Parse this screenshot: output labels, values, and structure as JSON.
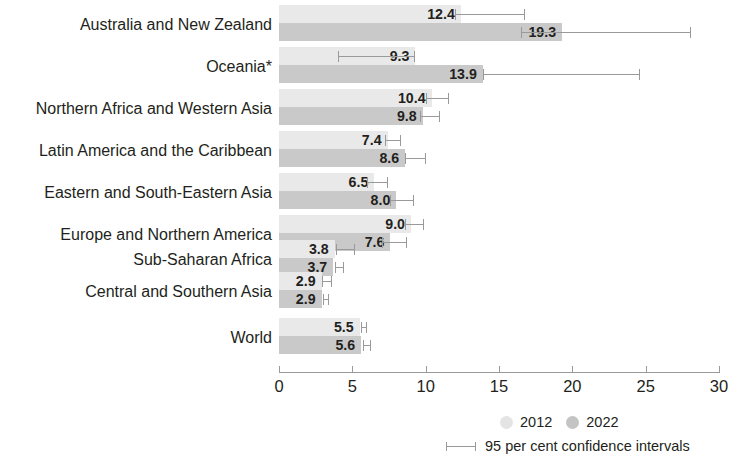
{
  "chart_data": {
    "type": "bar",
    "orientation": "horizontal",
    "title": "",
    "subtitle": "",
    "xlabel": "",
    "ylabel": "",
    "xlim": [
      0,
      30
    ],
    "xticks": [
      0,
      5,
      10,
      15,
      20,
      25,
      30
    ],
    "xtick_labels": [
      "0",
      "5",
      "10",
      "15",
      "20",
      "25",
      "30"
    ],
    "grid": false,
    "legend_position": "bottom-right",
    "legend_entries": [
      "2012",
      "2022"
    ],
    "ci_note": "95 per cent confidence intervals",
    "footnote_marker": "*",
    "categories": [
      "Australia and New Zealand",
      "Oceania*",
      "Northern Africa and Western Asia",
      "Latin America and the Caribbean",
      "Eastern and South-Eastern Asia",
      "Europe and Northern America",
      "Sub-Saharan Africa",
      "Central and Southern Asia",
      "World"
    ],
    "series": [
      {
        "name": "2012",
        "color": "#e9e9e9",
        "values": [
          12.4,
          9.3,
          10.4,
          7.4,
          6.5,
          9.0,
          3.8,
          2.9,
          5.5
        ],
        "ci_low": [
          12.0,
          4.0,
          10.0,
          7.2,
          6.0,
          8.6,
          3.9,
          2.9,
          5.6
        ],
        "ci_high": [
          16.8,
          9.3,
          11.6,
          8.3,
          7.4,
          9.9,
          5.2,
          3.6,
          6.0
        ]
      },
      {
        "name": "2022",
        "color": "#c9c9c9",
        "values": [
          19.3,
          13.9,
          9.8,
          8.6,
          8.0,
          7.6,
          3.7,
          2.9,
          5.6
        ],
        "ci_low": [
          16.5,
          13.9,
          9.6,
          8.6,
          7.6,
          7.0,
          3.8,
          3.0,
          5.7
        ],
        "ci_high": [
          28.1,
          24.6,
          11.0,
          10.0,
          9.2,
          8.7,
          4.4,
          3.4,
          6.3
        ]
      }
    ],
    "rows": [
      {
        "category": "Australia and New Zealand",
        "v2012": "12.4",
        "v2022": "19.3"
      },
      {
        "category": "Oceania*",
        "v2012": "9.3",
        "v2022": "13.9"
      },
      {
        "category": "Northern Africa and Western Asia",
        "v2012": "10.4",
        "v2022": "9.8"
      },
      {
        "category": "Latin America and the Caribbean",
        "v2012": "7.4",
        "v2022": "8.6"
      },
      {
        "category": "Eastern and South-Eastern Asia",
        "v2012": "6.5",
        "v2022": "8.0"
      },
      {
        "category": "Europe and Northern America",
        "v2012": "9.0",
        "v2022": "7.6"
      },
      {
        "category": "Sub-Saharan Africa",
        "v2012": "3.8",
        "v2022": "3.7"
      },
      {
        "category": "Central and Southern Asia",
        "v2012": "2.9",
        "v2022": "2.9"
      },
      {
        "category": "World",
        "v2012": "5.5",
        "v2022": "5.6"
      }
    ]
  },
  "legend": {
    "series_2012": "2012",
    "series_2022": "2022",
    "ci_label": "95 per cent confidence intervals"
  },
  "axis": {
    "tick_0": "0",
    "tick_1": "5",
    "tick_2": "10",
    "tick_3": "15",
    "tick_4": "20",
    "tick_5": "25",
    "tick_6": "30"
  }
}
